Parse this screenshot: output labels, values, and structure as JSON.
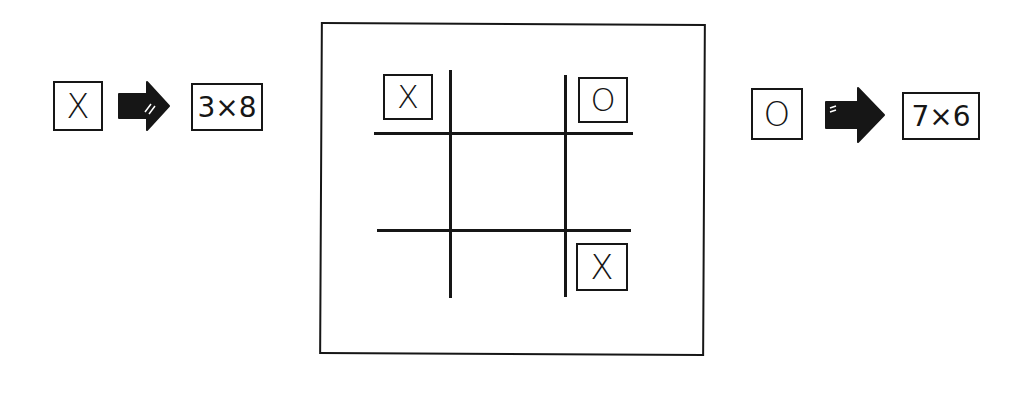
{
  "legend": [
    {
      "symbol": "X",
      "arrow": "right-arrow-icon",
      "formula": "3×8"
    },
    {
      "symbol": "O",
      "arrow": "right-arrow-icon",
      "formula": "7×6"
    }
  ],
  "board": {
    "rows": 3,
    "cols": 3,
    "cells": [
      [
        "X",
        "",
        "O"
      ],
      [
        "",
        "",
        ""
      ],
      [
        "",
        "",
        "X"
      ]
    ]
  },
  "colors": {
    "ink": "#161616",
    "background": "#ffffff"
  }
}
